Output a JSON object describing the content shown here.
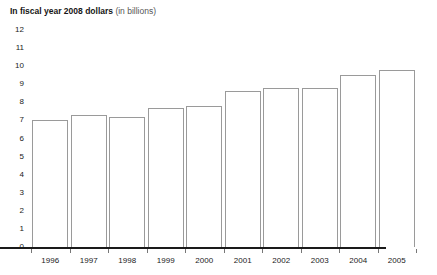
{
  "title": {
    "main": "In fiscal year 2008 dollars",
    "sub": "(in billions)"
  },
  "colors": {
    "bar_fill": "#ffffff",
    "bar_outline": "#9a9a9a",
    "baseline": "#1a1a1a",
    "text": "#1a1a1a",
    "subtitle_text": "#555555",
    "background": "#ffffff"
  },
  "chart_data": {
    "type": "bar",
    "title": "In fiscal year 2008 dollars (in billions)",
    "xlabel": "",
    "ylabel": "",
    "ylim": [
      0,
      12
    ],
    "ytick_step": 1,
    "grid": false,
    "legend": "none",
    "categories": [
      "1996",
      "1997",
      "1998",
      "1999",
      "2000",
      "2001",
      "2002",
      "2003",
      "2004",
      "2005"
    ],
    "values": [
      7.0,
      7.3,
      7.2,
      7.7,
      7.8,
      8.6,
      8.8,
      8.8,
      9.5,
      9.8
    ],
    "ytick_labels": [
      "12",
      "11",
      "10",
      "9",
      "8",
      "7",
      "6",
      "5",
      "4",
      "3",
      "2",
      "1",
      "0"
    ],
    "ytick_values": [
      12,
      11,
      10,
      9,
      8,
      7,
      6,
      5,
      4,
      3,
      2,
      1,
      0
    ]
  }
}
